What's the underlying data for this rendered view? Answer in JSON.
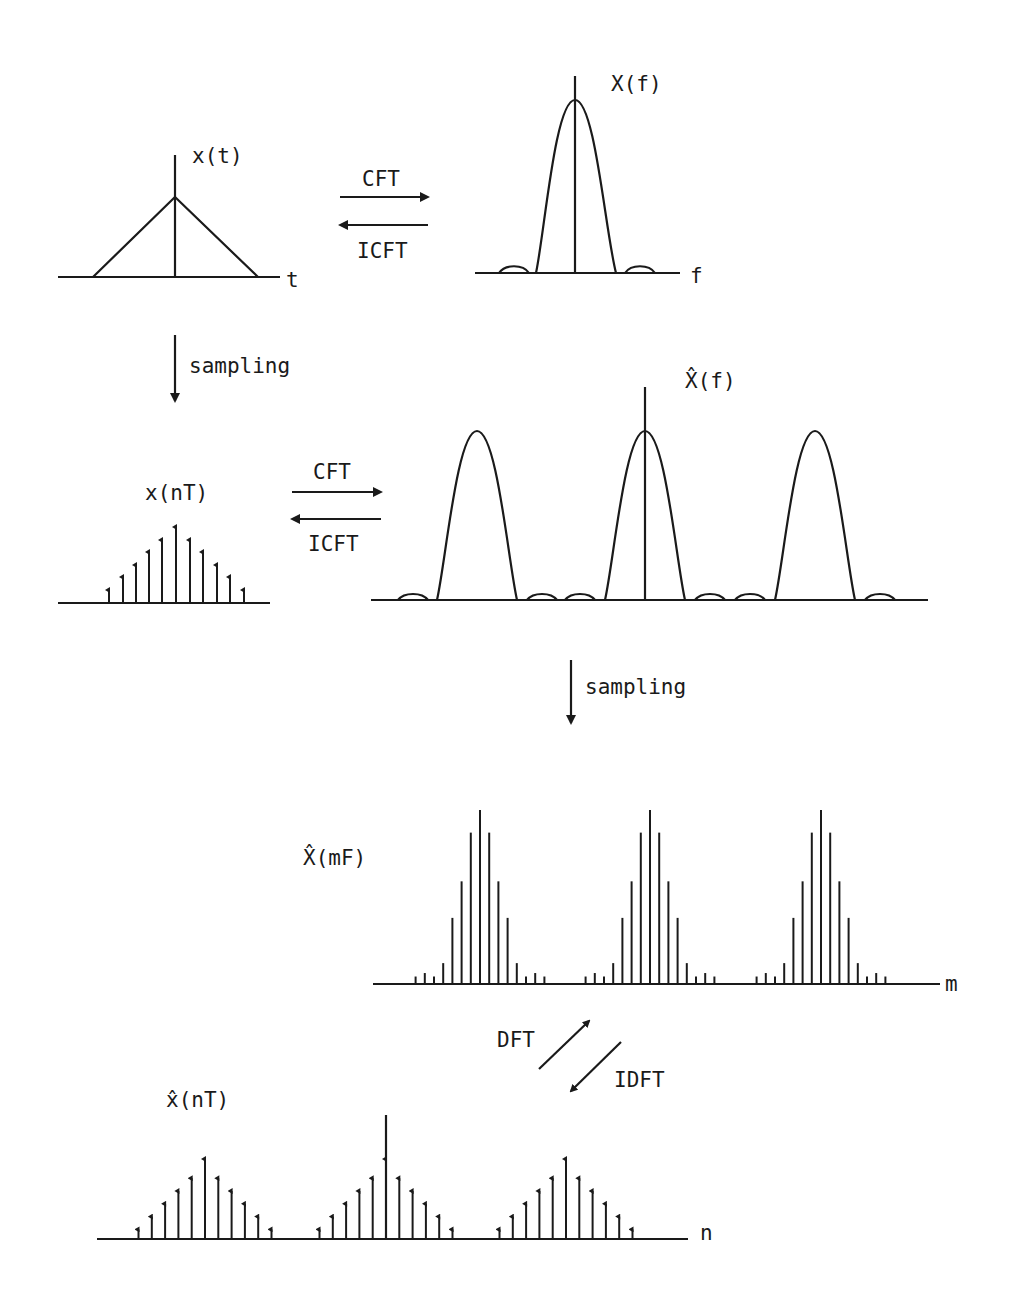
{
  "labels": {
    "x_t": "x(t)",
    "t_axis": "t",
    "X_f": "X(f)",
    "f_axis": "f",
    "cft_1": "CFT",
    "icft_1": "ICFT",
    "sampling_1": "sampling",
    "x_nT": "x(nT)",
    "cft_2": "CFT",
    "icft_2": "ICFT",
    "Xhat_f": "X̂(f)",
    "sampling_2": "sampling",
    "Xhat_mF": "X̂(mF)",
    "m_axis": "m",
    "dft": "DFT",
    "idft": "IDFT",
    "xhat_nT": "x̂(nT)",
    "n_axis": "n"
  },
  "colors": {
    "ink": "#1a1a1a",
    "background": "#ffffff"
  },
  "panels": [
    {
      "id": "x_t",
      "type": "continuous triangle pulse",
      "domain": "time"
    },
    {
      "id": "X_f",
      "type": "continuous sinc-squared spectrum",
      "domain": "frequency"
    },
    {
      "id": "x_nT",
      "type": "sampled triangle",
      "samples": 11,
      "relative_heights": [
        0.12,
        0.28,
        0.44,
        0.6,
        0.76,
        1.0,
        0.76,
        0.6,
        0.44,
        0.28,
        0.12
      ]
    },
    {
      "id": "Xhat_f",
      "type": "periodic continuous spectrum",
      "periods_visible": 3
    },
    {
      "id": "Xhat_mF",
      "type": "sampled periodic spectrum",
      "periods_visible": 3,
      "relative_heights": [
        0.02,
        0.04,
        0.02,
        0.12,
        0.38,
        0.59,
        0.87,
        1.0,
        0.87,
        0.59,
        0.38,
        0.12,
        0.02,
        0.04,
        0.02
      ]
    },
    {
      "id": "xhat_nT",
      "type": "periodic sampled triangle",
      "periods_visible": 3,
      "samples_per_period": 11
    }
  ]
}
